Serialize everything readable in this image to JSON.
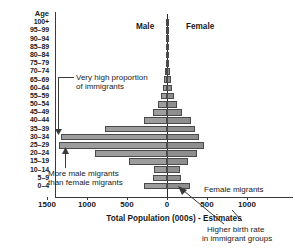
{
  "chart_data": {
    "type": "bar",
    "subtype": "population-pyramid",
    "title": "",
    "xlabel": "Total Population (000s) - Estimates",
    "ylabel": "Age",
    "xlim": [
      -1500,
      1000
    ],
    "xticks": [
      1500,
      1000,
      500,
      0,
      500,
      1000
    ],
    "grid": false,
    "legend": [
      "Male",
      "Female"
    ],
    "categories": [
      "100+",
      "95–99",
      "90–94",
      "85–89",
      "80–84",
      "75–79",
      "70–74",
      "65–69",
      "60–64",
      "55–59",
      "50–54",
      "45–49",
      "40–44",
      "35–39",
      "30–34",
      "25–29",
      "20–24",
      "15–19",
      "10–14",
      "5–9",
      "0–4"
    ],
    "series": [
      {
        "name": "Male",
        "direction": "left",
        "values": [
          2,
          3,
          5,
          8,
          12,
          18,
          25,
          35,
          55,
          80,
          115,
          175,
          290,
          770,
          1320,
          1350,
          900,
          480,
          165,
          175,
          290
        ]
      },
      {
        "name": "Female",
        "direction": "right",
        "values": [
          3,
          5,
          8,
          12,
          18,
          25,
          35,
          45,
          65,
          90,
          125,
          185,
          300,
          350,
          400,
          460,
          380,
          265,
          165,
          180,
          290
        ]
      }
    ],
    "annotations": [
      {
        "text": "Very high proportion of immigrants",
        "target": "30–34"
      },
      {
        "text": "More male migrants than female migrants",
        "target": "20–24"
      },
      {
        "text": "Female migrants",
        "target": "0–4"
      },
      {
        "text": "Higher birth rate in immigrant groups",
        "target": "0–4"
      }
    ]
  },
  "axis": {
    "age_header": "Age",
    "age_labels": [
      "100+",
      "95–99",
      "90–94",
      "85–89",
      "80–84",
      "75–79",
      "70–74",
      "65–69",
      "60–64",
      "55–59",
      "50–54",
      "45–49",
      "40–44",
      "35–39",
      "30–34",
      "25–29",
      "20–24",
      "15–19",
      "10–14",
      "5–9",
      "0–4"
    ],
    "xtick_labels": [
      "1500",
      "1000",
      "500",
      "0",
      "500",
      "1000"
    ],
    "xtitle": "Total Population (000s) - Estimates"
  },
  "headers": {
    "male": "Male",
    "female": "Female"
  },
  "annotations": {
    "immigrants_line1": "Very high proportion",
    "immigrants_line2": "of immigrants",
    "migrants_line1": "More male migrants",
    "migrants_line2": "than female migrants",
    "female_migrants": "Female migrants",
    "birthrate_line1": "Higher birth rate",
    "birthrate_line2": "in immigrant groups"
  },
  "colors": {
    "bar_male": "#9d9d9d",
    "bar_female": "#8e8e8e",
    "bar_border": "#4a4a4a",
    "axis": "#3a3a3a",
    "text": "#1a1a1a",
    "background": "#ffffff"
  }
}
